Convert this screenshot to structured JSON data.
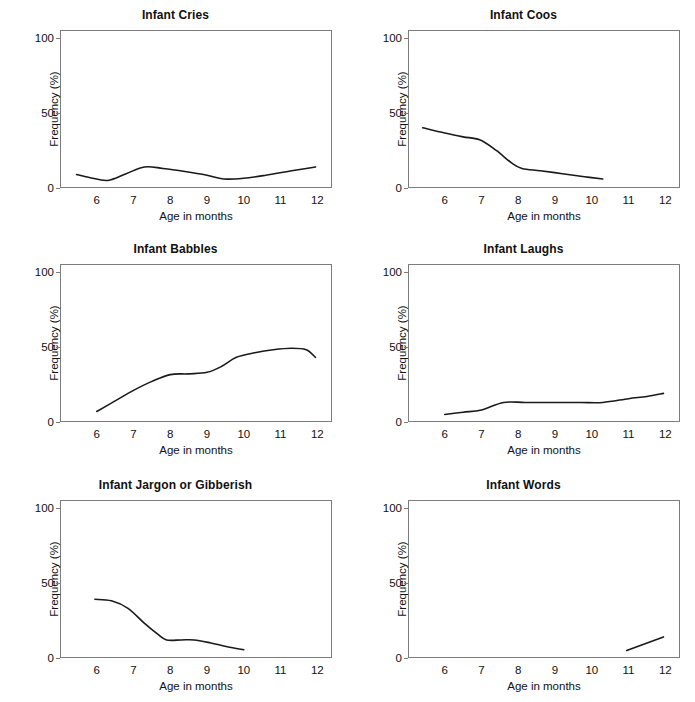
{
  "figure": {
    "background_color": "#ffffff",
    "line_color": "#1a1a1a",
    "frame_color": "#7d7d7d",
    "rows": 3,
    "columns": 2
  },
  "chart_data": [
    {
      "type": "line",
      "title": "Infant Cries",
      "xlabel": "Age in months",
      "ylabel": "Frequency (%)",
      "xlim": [
        5,
        12.4
      ],
      "ylim": [
        0,
        105
      ],
      "xticks": [
        6,
        7,
        8,
        9,
        10,
        11,
        12
      ],
      "yticks": [
        0,
        50,
        100
      ],
      "xtick_labels": [
        "6",
        "7",
        "8",
        "9",
        "10",
        "11",
        "12"
      ],
      "ytick_labels": [
        "0",
        "50",
        "100"
      ],
      "grid": false,
      "legend": "none",
      "x": [
        5.45,
        5.8,
        6.3,
        6.8,
        7.3,
        7.8,
        8.4,
        9.0,
        9.45,
        10.0,
        10.6,
        11.2,
        11.7,
        11.95
      ],
      "y": [
        9.0,
        7.0,
        5.0,
        9.5,
        14.0,
        13.0,
        11.0,
        8.5,
        6.0,
        6.5,
        8.5,
        11.0,
        13.0,
        14.0
      ]
    },
    {
      "type": "line",
      "title": "Infant Coos",
      "xlabel": "Age in months",
      "ylabel": "Frequency (%)",
      "xlim": [
        5,
        12.4
      ],
      "ylim": [
        0,
        105
      ],
      "xticks": [
        6,
        7,
        8,
        9,
        10,
        11,
        12
      ],
      "yticks": [
        0,
        50,
        100
      ],
      "xtick_labels": [
        "6",
        "7",
        "8",
        "9",
        "10",
        "11",
        "12"
      ],
      "ytick_labels": [
        "0",
        "50",
        "100"
      ],
      "grid": false,
      "legend": "none",
      "x": [
        5.4,
        6.0,
        6.5,
        6.95,
        7.4,
        7.8,
        8.1,
        8.6,
        9.2,
        9.8,
        10.3
      ],
      "y": [
        40.0,
        36.5,
        34.0,
        32.0,
        25.0,
        17.0,
        13.0,
        11.5,
        9.5,
        7.5,
        6.0
      ]
    },
    {
      "type": "line",
      "title": "Infant Babbles",
      "xlabel": "Age in months",
      "ylabel": "Frequency (%)",
      "xlim": [
        5,
        12.4
      ],
      "ylim": [
        0,
        105
      ],
      "xticks": [
        6,
        7,
        8,
        9,
        10,
        11,
        12
      ],
      "yticks": [
        0,
        50,
        100
      ],
      "xtick_labels": [
        "6",
        "7",
        "8",
        "9",
        "10",
        "11",
        "12"
      ],
      "ytick_labels": [
        "0",
        "50",
        "100"
      ],
      "grid": false,
      "legend": "none",
      "x": [
        6.0,
        6.5,
        7.0,
        7.5,
        8.0,
        8.5,
        9.0,
        9.4,
        9.8,
        10.3,
        10.8,
        11.3,
        11.7,
        11.95
      ],
      "y": [
        7.0,
        14.0,
        21.0,
        27.0,
        31.5,
        32.0,
        33.0,
        37.0,
        43.0,
        46.0,
        48.0,
        49.0,
        48.0,
        43.0
      ]
    },
    {
      "type": "line",
      "title": "Infant Laughs",
      "xlabel": "Age in months",
      "ylabel": "Frequency (%)",
      "xlim": [
        5,
        12.4
      ],
      "ylim": [
        0,
        105
      ],
      "xticks": [
        6,
        7,
        8,
        9,
        10,
        11,
        12
      ],
      "yticks": [
        0,
        50,
        100
      ],
      "xtick_labels": [
        "6",
        "7",
        "8",
        "9",
        "10",
        "11",
        "12"
      ],
      "ytick_labels": [
        "0",
        "50",
        "100"
      ],
      "grid": false,
      "legend": "none",
      "x": [
        6.0,
        6.5,
        7.0,
        7.6,
        8.2,
        9.0,
        9.7,
        10.3,
        11.0,
        11.5,
        11.95
      ],
      "y": [
        5.0,
        6.5,
        8.0,
        13.0,
        13.0,
        13.0,
        13.0,
        13.0,
        15.5,
        17.0,
        19.0
      ]
    },
    {
      "type": "line",
      "title": "Infant Jargon or Gibberish",
      "xlabel": "Age in months",
      "ylabel": "Frequency (%)",
      "xlim": [
        5,
        12.4
      ],
      "ylim": [
        0,
        105
      ],
      "xticks": [
        6,
        7,
        8,
        9,
        10,
        11,
        12
      ],
      "yticks": [
        0,
        50,
        100
      ],
      "xtick_labels": [
        "6",
        "7",
        "8",
        "9",
        "10",
        "11",
        "12"
      ],
      "ytick_labels": [
        "0",
        "50",
        "100"
      ],
      "grid": false,
      "legend": "none",
      "x": [
        5.95,
        6.4,
        6.85,
        7.3,
        7.65,
        7.9,
        8.3,
        8.65,
        9.1,
        9.55,
        10.0
      ],
      "y": [
        39.0,
        38.0,
        33.0,
        23.0,
        16.0,
        12.0,
        12.0,
        12.0,
        10.0,
        7.5,
        5.5
      ]
    },
    {
      "type": "line",
      "title": "Infant Words",
      "xlabel": "Age in months",
      "ylabel": "Frequency (%)",
      "xlim": [
        5,
        12.4
      ],
      "ylim": [
        0,
        105
      ],
      "xticks": [
        6,
        7,
        8,
        9,
        10,
        11,
        12
      ],
      "yticks": [
        0,
        50,
        100
      ],
      "xtick_labels": [
        "6",
        "7",
        "8",
        "9",
        "10",
        "11",
        "12"
      ],
      "ytick_labels": [
        "0",
        "50",
        "100"
      ],
      "grid": false,
      "legend": "none",
      "x": [
        10.95,
        11.95
      ],
      "y": [
        5.0,
        14.0
      ]
    }
  ]
}
